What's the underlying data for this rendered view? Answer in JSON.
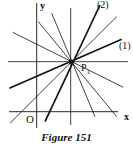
{
  "figure": {
    "caption": "Figure 151",
    "labels": {
      "y_axis": "y",
      "x_axis": "x",
      "origin": "O",
      "point": "P",
      "point_sub": "1",
      "line1": "(1)",
      "line2": "(2)"
    },
    "point_P1": [
      70.7,
      61.7
    ],
    "axes": {
      "y": [
        [
          36.7,
          3
        ],
        [
          36.7,
          128
        ]
      ],
      "x": [
        [
          9,
          111.7
        ],
        [
          118,
          111.7
        ]
      ]
    },
    "pencil_lines": [
      {
        "from": [
          70.7,
          8
        ],
        "to": [
          70.7,
          125
        ],
        "weight": "thin"
      },
      {
        "from": [
          8,
          61.7
        ],
        "to": [
          128,
          61.7
        ],
        "weight": "thin"
      },
      {
        "from": [
          9.3,
          88.3
        ],
        "to": [
          121.7,
          39.3
        ],
        "weight": "bold",
        "label": "(1)"
      },
      {
        "from": [
          45,
          121.7
        ],
        "to": [
          100,
          5
        ],
        "weight": "bold",
        "label": "(2)"
      },
      {
        "from": [
          38.3,
          21.7
        ],
        "to": [
          116.7,
          116.7
        ],
        "weight": "thin"
      },
      {
        "from": [
          12.7,
          32.3
        ],
        "to": [
          123.3,
          87.3
        ],
        "weight": "thin"
      },
      {
        "from": [
          51.7,
          13.3
        ],
        "to": [
          95,
          116.7
        ],
        "weight": "thin"
      },
      {
        "from": [
          10,
          123.3
        ],
        "to": [
          116.7,
          16.7
        ],
        "weight": "thin"
      }
    ]
  }
}
